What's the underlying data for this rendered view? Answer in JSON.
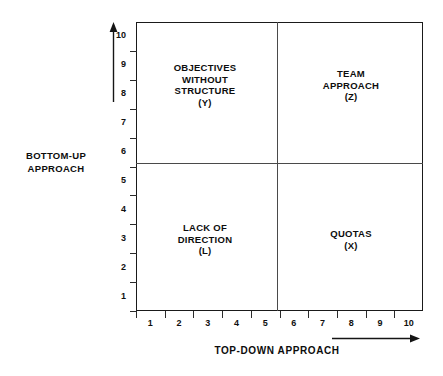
{
  "figure": {
    "type": "quadrant-matrix",
    "background": "#ffffff",
    "line_color": "#1a1a1a"
  },
  "axes": {
    "x_title": "TOP-DOWN APPROACH",
    "y_title_line1": "BOTTOM-UP",
    "y_title_line2": "APPROACH",
    "x_ticks": [
      "1",
      "2",
      "3",
      "4",
      "5",
      "6",
      "7",
      "8",
      "9",
      "10"
    ],
    "y_ticks": [
      "1",
      "2",
      "3",
      "4",
      "5",
      "6",
      "7",
      "8",
      "9",
      "10"
    ],
    "x_arrow": "arrow-right-icon",
    "y_arrow": "arrow-up-icon"
  },
  "quadrants": [
    {
      "key": "top-left",
      "lines": [
        "OBJECTIVES",
        "WITHOUT",
        "STRUCTURE"
      ],
      "tag": "(Y)"
    },
    {
      "key": "top-right",
      "lines": [
        "TEAM",
        "APPROACH"
      ],
      "tag": "(Z)"
    },
    {
      "key": "bottom-left",
      "lines": [
        "LACK  OF",
        "DIRECTION"
      ],
      "tag": "(L)"
    },
    {
      "key": "bottom-right",
      "lines": [
        "QUOTAS"
      ],
      "tag": "(X)"
    }
  ],
  "chart_data": {
    "type": "scatter",
    "title": "",
    "xlabel": "TOP-DOWN APPROACH",
    "ylabel": "BOTTOM-UP APPROACH",
    "xlim": [
      0.5,
      10.5
    ],
    "ylim": [
      0.5,
      10.5
    ],
    "grid": false,
    "legend": "none",
    "x_tick_labels": [
      "1",
      "2",
      "3",
      "4",
      "5",
      "6",
      "7",
      "8",
      "9",
      "10"
    ],
    "y_tick_labels": [
      "1",
      "2",
      "3",
      "4",
      "5",
      "6",
      "7",
      "8",
      "9",
      "10"
    ],
    "x_divider": 5.5,
    "y_divider": 5.5,
    "annotations": [
      {
        "label": "OBJECTIVES WITHOUT STRUCTURE (Y)",
        "quadrant": "top-left",
        "x_range": [
          0.5,
          5.5
        ],
        "y_range": [
          5.5,
          10.5
        ]
      },
      {
        "label": "TEAM APPROACH (Z)",
        "quadrant": "top-right",
        "x_range": [
          5.5,
          10.5
        ],
        "y_range": [
          5.5,
          10.5
        ]
      },
      {
        "label": "LACK OF DIRECTION (L)",
        "quadrant": "bottom-left",
        "x_range": [
          0.5,
          5.5
        ],
        "y_range": [
          0.5,
          5.5
        ]
      },
      {
        "label": "QUOTAS (X)",
        "quadrant": "bottom-right",
        "x_range": [
          5.5,
          10.5
        ],
        "y_range": [
          0.5,
          5.5
        ]
      }
    ]
  }
}
